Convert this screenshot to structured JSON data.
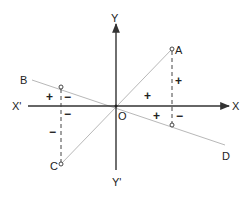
{
  "diagram": {
    "type": "coordinate-axes-with-lines",
    "axes": {
      "x_positive_label": "X",
      "x_negative_label": "X'",
      "y_positive_label": "Y",
      "y_negative_label": "Y'",
      "origin_label": "O"
    },
    "lines": [
      {
        "name": "AC",
        "from_label": "A",
        "to_label": "C"
      },
      {
        "name": "BD",
        "from_label": "B",
        "to_label": "D"
      }
    ],
    "points": {
      "A": "A",
      "B": "B",
      "C": "C",
      "D": "D"
    },
    "signs": {
      "left_upper_plus": "+",
      "left_upper_minus": "−",
      "left_lower_minus_near_axis": "−",
      "left_lower_minus": "−",
      "center_plus": "+",
      "right_plus_vertical": "+",
      "right_plus_below_axis": "+",
      "right_minus_below_axis": "−"
    },
    "colors": {
      "axis": "#333333",
      "line": "#b0b0b0",
      "dashed": "#444444"
    }
  }
}
